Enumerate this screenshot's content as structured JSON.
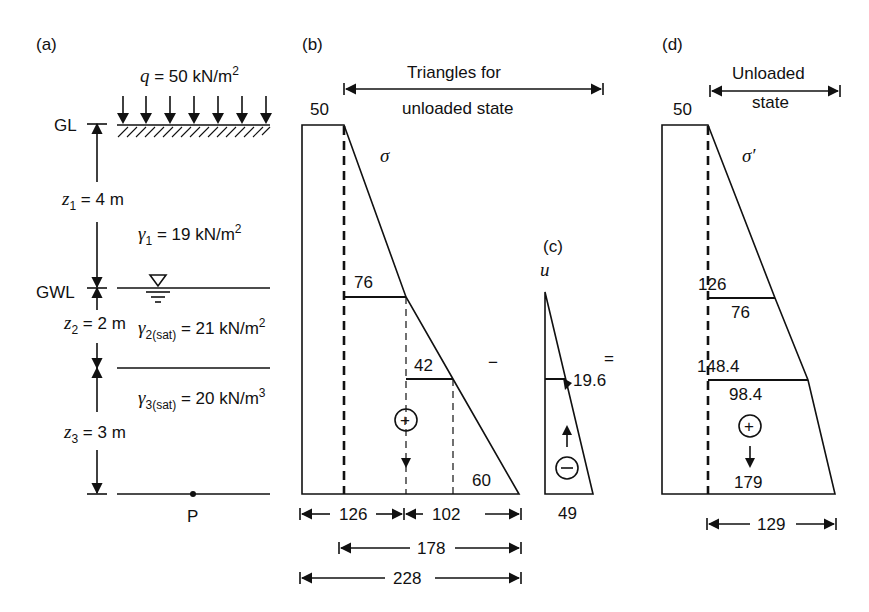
{
  "panels": {
    "a": {
      "label": "(a)",
      "surcharge": {
        "symbol": "q",
        "eq": " = 50 kN/m",
        "exp": "2"
      },
      "gl_label": "GL",
      "gwl_label": "GWL",
      "point_label": "P",
      "layers": [
        {
          "z_sym": "z",
          "z_sub": "1",
          "z_val": " = 4 m",
          "g_sym": "γ",
          "g_sub": "1",
          "g_val": " = 19 kN/m",
          "g_exp": "2"
        },
        {
          "z_sym": "z",
          "z_sub": "2",
          "z_val": " = 2 m",
          "g_sym": "γ",
          "g_sub": "2(sat)",
          "g_val": " = 21 kN/m",
          "g_exp": "2"
        },
        {
          "z_sym": "z",
          "z_sub": "3",
          "z_val": " = 3 m",
          "g_sym": "γ",
          "g_sub": "3(sat)",
          "g_val": " = 20 kN/m",
          "g_exp": "3"
        }
      ]
    },
    "b": {
      "label": "(b)",
      "header_line1": "Triangles for",
      "header_line2": "unloaded state",
      "symbol": "σ",
      "top_value": "50",
      "values": [
        "76",
        "42",
        "60"
      ],
      "sign": "+",
      "dims": [
        "126",
        "102",
        "178",
        "228"
      ]
    },
    "c": {
      "label": "(c)",
      "symbol": "u",
      "mid_value": "19.6",
      "bottom_value": "49",
      "sign": "−"
    },
    "d": {
      "label": "(d)",
      "header_line1": "Unloaded",
      "header_line2": "state",
      "symbol": "σ′",
      "top_value": "50",
      "level1_total": "126",
      "level1_triangle": "76",
      "level2_total": "148.4",
      "level2_triangle": "98.4",
      "bottom_value": "179",
      "sign": "+",
      "dim": "129"
    },
    "operators": {
      "minus": "−",
      "equals": "="
    }
  }
}
